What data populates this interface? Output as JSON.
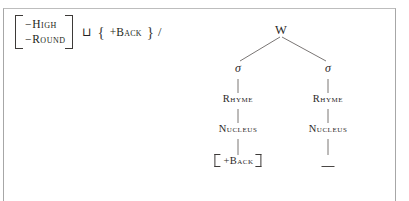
{
  "figure": {
    "clipped_header_text": "",
    "rule": {
      "input_matrix": {
        "rows": [
          {
            "sign": "−",
            "feature": "High"
          },
          {
            "sign": "−",
            "feature": "Round"
          }
        ]
      },
      "operator": "⊔",
      "set_open": "{",
      "set_content": "+Back",
      "set_close": "}",
      "environment_slash": "/"
    },
    "tree": {
      "root": {
        "label": "W",
        "x": 80,
        "y": 0
      },
      "syllables": [
        {
          "label": "σ",
          "x": 38,
          "y": 44
        },
        {
          "label": "σ",
          "x": 128,
          "y": 44
        }
      ],
      "rhymes": [
        {
          "label": "Rhyme",
          "x": 38,
          "y": 76
        },
        {
          "label": "Rhyme",
          "x": 128,
          "y": 76
        }
      ],
      "nuclei": [
        {
          "label": "Nucleus",
          "x": 38,
          "y": 106
        },
        {
          "label": "Nucleus",
          "x": 128,
          "y": 106
        }
      ],
      "terminals": [
        {
          "type": "matrix",
          "label": "+Back",
          "x": 38,
          "y": 138
        },
        {
          "type": "blank",
          "label": "_",
          "x": 128,
          "y": 138
        }
      ],
      "edges": [
        {
          "from": "root",
          "to": "sigma-left",
          "x1": 80,
          "y1": 14,
          "x2": 40,
          "y2": 38
        },
        {
          "from": "root",
          "to": "sigma-right",
          "x1": 82,
          "y1": 14,
          "x2": 126,
          "y2": 38
        },
        {
          "from": "sigma-left",
          "to": "rhyme-left",
          "x1": 38,
          "y1": 56,
          "x2": 38,
          "y2": 70
        },
        {
          "from": "sigma-right",
          "to": "rhyme-right",
          "x1": 128,
          "y1": 56,
          "x2": 128,
          "y2": 70
        },
        {
          "from": "rhyme-left",
          "to": "nucleus-left",
          "x1": 38,
          "y1": 86,
          "x2": 38,
          "y2": 100
        },
        {
          "from": "rhyme-right",
          "to": "nucleus-right",
          "x1": 128,
          "y1": 86,
          "x2": 128,
          "y2": 100
        },
        {
          "from": "nucleus-left",
          "to": "terminal-left",
          "x1": 38,
          "y1": 116,
          "x2": 38,
          "y2": 132
        },
        {
          "from": "nucleus-right",
          "to": "terminal-right",
          "x1": 128,
          "y1": 116,
          "x2": 128,
          "y2": 132
        }
      ]
    }
  },
  "colors": {
    "ink": "#2b2827",
    "line": "#6b6765",
    "frame": "#a7a7a7",
    "background": "#ffffff"
  }
}
